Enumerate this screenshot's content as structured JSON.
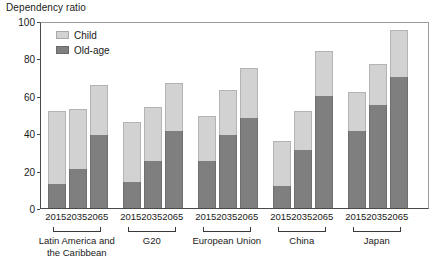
{
  "chart": {
    "title": "Dependency ratio",
    "legend": {
      "position": "top-left-inside",
      "entries": [
        {
          "label": "Child",
          "color": "#d2d2d2",
          "icon": "square-swatch-icon"
        },
        {
          "label": "Old-age",
          "color": "#7f7f7f",
          "icon": "square-swatch-icon"
        }
      ]
    },
    "y_axis": {
      "label": "Dependency ratio",
      "ticks": [
        "0",
        "20",
        "40",
        "60",
        "80",
        "100"
      ],
      "min": 0,
      "max": 100
    },
    "x_axis": {
      "tick_labels": [
        "2015",
        "2035",
        "2065",
        "2015",
        "2035",
        "2065",
        "2015",
        "2035",
        "2065",
        "2015",
        "2035",
        "2065",
        "2015",
        "2035",
        "2065"
      ],
      "groups": [
        "Latin America and the Caribbean",
        "G20",
        "European Union",
        "China",
        "Japan"
      ]
    }
  },
  "chart_data": {
    "type": "bar",
    "subtype": "stacked",
    "title": "Dependency ratio",
    "xlabel": "",
    "ylabel": "Dependency ratio",
    "ylim": [
      0,
      100
    ],
    "yticks": [
      0,
      20,
      40,
      60,
      80,
      100
    ],
    "grid": false,
    "legend": [
      "Child",
      "Old-age"
    ],
    "legend_position": "top-left inside plot",
    "categories": [
      "Latin America and the Caribbean 2015",
      "Latin America and the Caribbean 2035",
      "Latin America and the Caribbean 2065",
      "G20 2015",
      "G20 2035",
      "G20 2065",
      "European Union 2015",
      "European Union 2035",
      "European Union 2065",
      "China 2015",
      "China 2035",
      "China 2065",
      "Japan 2015",
      "Japan 2035",
      "Japan 2065"
    ],
    "groups": [
      {
        "name": "Latin America and the Caribbean",
        "years": [
          "2015",
          "2035",
          "2065"
        ]
      },
      {
        "name": "G20",
        "years": [
          "2015",
          "2035",
          "2065"
        ]
      },
      {
        "name": "European Union",
        "years": [
          "2015",
          "2035",
          "2065"
        ]
      },
      {
        "name": "China",
        "years": [
          "2015",
          "2035",
          "2065"
        ]
      },
      {
        "name": "Japan",
        "years": [
          "2015",
          "2035",
          "2065"
        ]
      }
    ],
    "series": [
      {
        "name": "Old-age",
        "color": "#7f7f7f",
        "values": [
          13,
          21,
          39,
          14,
          25,
          41,
          25,
          39,
          48,
          12,
          31,
          60,
          41,
          55,
          70
        ]
      },
      {
        "name": "Child",
        "color": "#d2d2d2",
        "values": [
          39,
          32,
          27,
          32,
          29,
          26,
          24,
          24,
          27,
          24,
          21,
          24,
          21,
          22,
          25
        ]
      }
    ],
    "totals": [
      52,
      53,
      66,
      46,
      54,
      67,
      49,
      63,
      75,
      36,
      52,
      84,
      62,
      77,
      95
    ]
  }
}
